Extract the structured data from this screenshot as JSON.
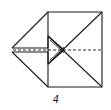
{
  "diagram": {
    "step_number": "4",
    "colors": {
      "line": "#1a1a1a",
      "background": "#ffffff"
    },
    "elements": [
      "square-outline",
      "left-triangular-flap",
      "diagonal-creases",
      "horizontal-dashed-fold-line",
      "arrow-shaped-inner-flap"
    ]
  }
}
